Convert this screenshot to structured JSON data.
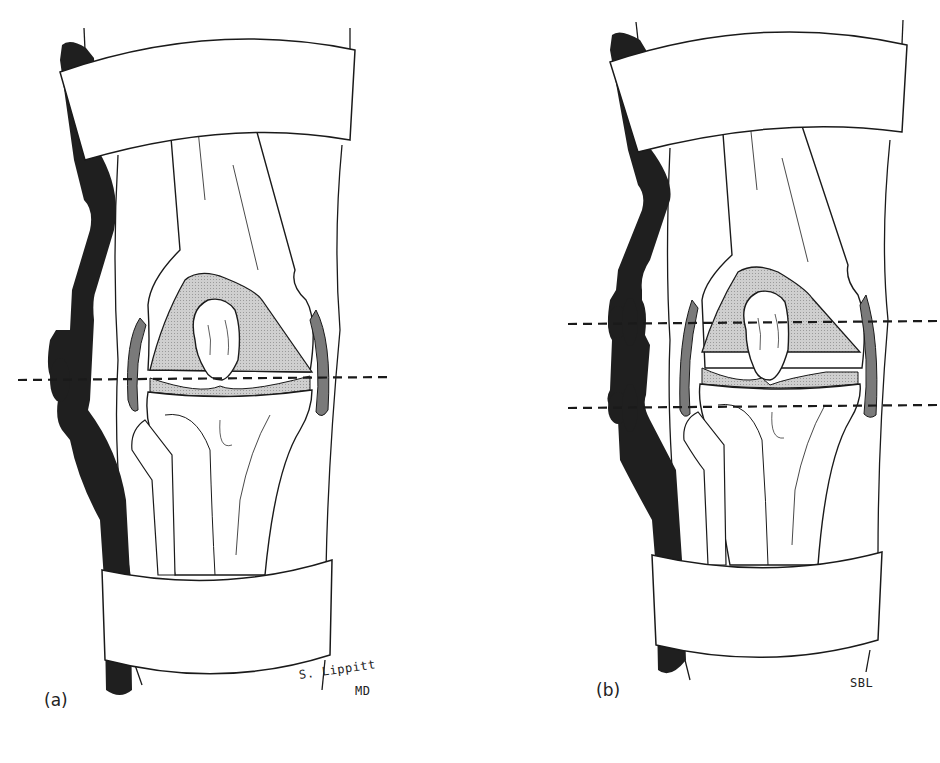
{
  "figure": {
    "panels": [
      {
        "id": "a",
        "label": "(a)",
        "signature_line1": "S. Lippitt",
        "signature_line2": "MD",
        "hinge_axis_count": 1,
        "description": "Knee brace with single-axis hinge aligned at joint line"
      },
      {
        "id": "b",
        "label": "(b)",
        "signature_line1": "SBL",
        "hinge_axis_count": 2,
        "description": "Knee brace with polycentric (two-axis) hinge"
      }
    ],
    "colors": {
      "outline": "#1a1a1a",
      "brace_upright": "#1f1f1f",
      "cartilage_fill": "#c8c8c8",
      "meniscus_fill": "#7a7a7a",
      "background": "#ffffff"
    }
  }
}
